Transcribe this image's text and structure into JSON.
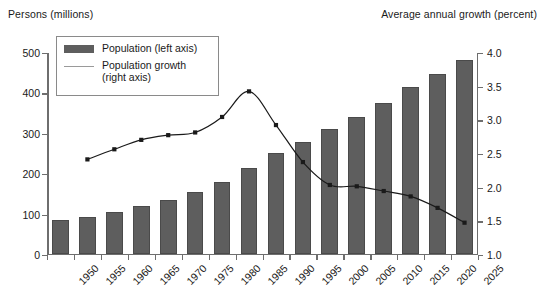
{
  "axis_titles": {
    "left": "Persons (millions)",
    "right": "Average annual growth (percent)"
  },
  "legend": {
    "bar_label": "Population (left axis)",
    "line_label_line1": "Population growth",
    "line_label_line2": "(right axis)"
  },
  "colors": {
    "bar_fill": "#5e5e5e",
    "bar_edge": "#4a4a4a",
    "line": "#1a1a1a",
    "axis": "#6e6e6e",
    "text": "#1a1a1a",
    "background": "#ffffff"
  },
  "chart_data": {
    "type": "bar",
    "title": "",
    "xlabel": "",
    "ylabel": "Persons (millions)",
    "y2label": "Average annual growth (percent)",
    "grid": false,
    "legend_position": "upper-left-inside",
    "categories": [
      "1950",
      "1955",
      "1960",
      "1965",
      "1970",
      "1975",
      "1980",
      "1985",
      "1990",
      "1995",
      "2000",
      "2005",
      "2010",
      "2015",
      "2020",
      "2025"
    ],
    "ylim": [
      0,
      500
    ],
    "yticks": [
      0,
      100,
      200,
      300,
      400,
      500
    ],
    "y2lim": [
      1.0,
      4.0
    ],
    "y2ticks": [
      1.0,
      1.5,
      2.0,
      2.5,
      3.0,
      3.5,
      4.0
    ],
    "ytick_labels": [
      "0",
      "100",
      "200",
      "300",
      "400",
      "500"
    ],
    "y2tick_labels": [
      "1.0",
      "1.5",
      "2.0",
      "2.5",
      "3.0",
      "3.5",
      "4.0"
    ],
    "series": [
      {
        "name": "Population (left axis)",
        "type": "bar",
        "axis": "left",
        "unit": "millions",
        "values": [
          82,
          91,
          102,
          117,
          133,
          152,
          177,
          211,
          248,
          276,
          307,
          339,
          373,
          411,
          445,
          480
        ]
      },
      {
        "name": "Population growth (right axis)",
        "type": "line",
        "axis": "right",
        "unit": "percent",
        "x": [
          "1955",
          "1960",
          "1965",
          "1970",
          "1975",
          "1980",
          "1985",
          "1990",
          "1995",
          "2000",
          "2005",
          "2010",
          "2015",
          "2020",
          "2025"
        ],
        "values": [
          2.42,
          2.57,
          2.71,
          2.78,
          2.82,
          3.05,
          3.43,
          2.93,
          2.38,
          2.04,
          2.02,
          1.95,
          1.87,
          1.7,
          1.48
        ]
      }
    ]
  }
}
